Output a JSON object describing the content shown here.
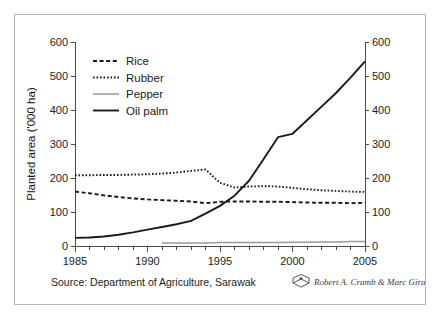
{
  "figure": {
    "source_note": "Source: Department of Agriculture, Sarawak",
    "credit": "Robert A. Cramb & Marc Girard",
    "credit_icon": "book-logo-icon"
  },
  "chart_data": {
    "type": "line",
    "title": "",
    "xlabel": "",
    "ylabel": "Planted area ('000 ha)",
    "xlim": [
      1985,
      2005
    ],
    "ylim": [
      0,
      600
    ],
    "xticks": [
      1985,
      1990,
      1995,
      2000,
      2005
    ],
    "xtick_labels": [
      "1985",
      "1990",
      "1995",
      "2000",
      "2005"
    ],
    "x_minor_step": 1,
    "yticks": [
      0,
      100,
      200,
      300,
      400,
      500,
      600
    ],
    "ytick_labels": [
      "0",
      "100",
      "200",
      "300",
      "400",
      "500",
      "600"
    ],
    "right_axis": true,
    "right_ylabel": "",
    "right_yticks": [
      0,
      100,
      200,
      300,
      400,
      500,
      600
    ],
    "right_ytick_labels": [
      "0",
      "100",
      "200",
      "300",
      "400",
      "500",
      "600"
    ],
    "grid": false,
    "legend_position": "upper-left",
    "x": [
      1985,
      1986,
      1987,
      1988,
      1989,
      1990,
      1991,
      1992,
      1993,
      1994,
      1995,
      1996,
      1997,
      1998,
      1999,
      2000,
      2001,
      2002,
      2003,
      2004,
      2005
    ],
    "series": [
      {
        "name": "Rice",
        "style": "dashed",
        "color": "#1a1a1a",
        "values": [
          160,
          155,
          149,
          144,
          140,
          137,
          135,
          133,
          131,
          126,
          130,
          131,
          131,
          130,
          130,
          129,
          128,
          127,
          127,
          126,
          127
        ]
      },
      {
        "name": "Rubber",
        "style": "dotted",
        "color": "#1a1a1a",
        "values": [
          208,
          208,
          209,
          209,
          210,
          211,
          213,
          216,
          221,
          225,
          186,
          172,
          175,
          176,
          175,
          171,
          167,
          164,
          162,
          160,
          159
        ]
      },
      {
        "name": "Pepper",
        "style": "solid-thin",
        "color": "#9a9a9a",
        "values": [
          null,
          null,
          null,
          null,
          null,
          null,
          9,
          9,
          9,
          9,
          10,
          10,
          10,
          10,
          10,
          11,
          11,
          12,
          12,
          13,
          13
        ]
      },
      {
        "name": "Oil palm",
        "style": "solid-thick",
        "color": "#1a1a1a",
        "values": [
          24,
          25,
          28,
          33,
          40,
          48,
          56,
          64,
          74,
          95,
          118,
          148,
          192,
          255,
          320,
          330,
          370,
          410,
          450,
          495,
          543
        ]
      }
    ]
  },
  "legend": {
    "items": [
      {
        "label": "Rice",
        "swatch": "dashed-line-swatch"
      },
      {
        "label": "Rubber",
        "swatch": "dotted-line-swatch"
      },
      {
        "label": "Pepper",
        "swatch": "thin-grey-line-swatch"
      },
      {
        "label": "Oil palm",
        "swatch": "thick-black-line-swatch"
      }
    ]
  }
}
